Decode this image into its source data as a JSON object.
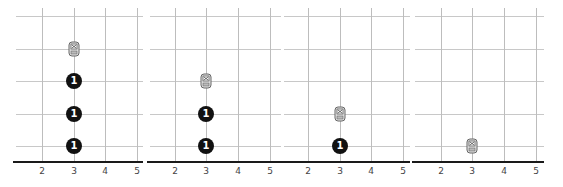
{
  "figure": {
    "panels": [
      {
        "id": "panel-1",
        "x_ticks": [
          "2",
          "3",
          "4",
          "5"
        ],
        "coins": [
          {
            "x": 3,
            "level": 1,
            "label": "1"
          },
          {
            "x": 3,
            "level": 2,
            "label": "1"
          },
          {
            "x": 3,
            "level": 3,
            "label": "1"
          }
        ],
        "robot": {
          "x": 3,
          "level": 4,
          "icon": "robot-icon"
        }
      },
      {
        "id": "panel-2",
        "x_ticks": [
          "2",
          "3",
          "4",
          "5"
        ],
        "coins": [
          {
            "x": 3,
            "level": 1,
            "label": "1"
          },
          {
            "x": 3,
            "level": 2,
            "label": "1"
          }
        ],
        "robot": {
          "x": 3,
          "level": 3,
          "icon": "robot-icon"
        }
      },
      {
        "id": "panel-3",
        "x_ticks": [
          "2",
          "3",
          "4",
          "5"
        ],
        "coins": [
          {
            "x": 3,
            "level": 1,
            "label": "1"
          }
        ],
        "robot": {
          "x": 3,
          "level": 2,
          "icon": "robot-icon"
        }
      },
      {
        "id": "panel-4",
        "x_ticks": [
          "2",
          "3",
          "4",
          "5"
        ],
        "coins": [],
        "robot": {
          "x": 3,
          "level": 1,
          "icon": "robot-icon"
        }
      }
    ],
    "colors": {
      "grid": "#c8c8c8",
      "axis": "#1a1a1a",
      "coin": "#111111",
      "coin_text": "#ffffff",
      "robot": "#777777"
    }
  }
}
